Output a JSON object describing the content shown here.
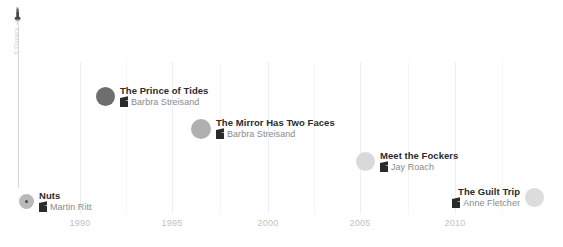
{
  "chart_data": {
    "type": "scatter",
    "title": "",
    "xlabel": "",
    "ylabel": "0 Oscars",
    "xlim": [
      1986,
      2013
    ],
    "grid": true,
    "x_ticks": [
      {
        "label": "1990",
        "x": 80
      },
      {
        "label": "1995",
        "x": 172
      },
      {
        "label": "2000",
        "x": 268
      },
      {
        "label": "2005",
        "x": 360
      },
      {
        "label": "2010",
        "x": 455
      }
    ],
    "minor_gridlines": [
      126,
      220,
      314,
      408,
      502
    ],
    "points": [
      {
        "title": "Nuts",
        "director": "Martin Ritt",
        "year": 1987,
        "marker_color": "#b9b9b9",
        "marker_size": 15,
        "selected": true,
        "label_side": "right",
        "x": 19,
        "y": 190
      },
      {
        "title": "The Prince of Tides",
        "director": "Barbra Streisand",
        "year": 1991,
        "marker_color": "#6e6e6e",
        "marker_size": 19,
        "selected": false,
        "label_side": "right",
        "x": 96,
        "y": 85
      },
      {
        "title": "The Mirror Has Two Faces",
        "director": "Barbra Streisand",
        "year": 1996,
        "marker_color": "#b0b0b0",
        "marker_size": 20,
        "selected": false,
        "label_side": "right",
        "x": 191,
        "y": 117
      },
      {
        "title": "Meet the Fockers",
        "director": "Jay Roach",
        "year": 2004,
        "marker_color": "#d9d9d9",
        "marker_size": 19,
        "selected": false,
        "label_side": "right",
        "x": 356,
        "y": 150
      },
      {
        "title": "The Guilt Trip",
        "director": "Anne Fletcher",
        "year": 2012,
        "marker_color": "#dcdcdc",
        "marker_size": 19,
        "selected": false,
        "label_side": "left",
        "x": 525,
        "y": 186
      }
    ]
  },
  "icons": {
    "oscar": "oscar-statuette-icon",
    "clapperboard": "clapperboard-icon"
  }
}
